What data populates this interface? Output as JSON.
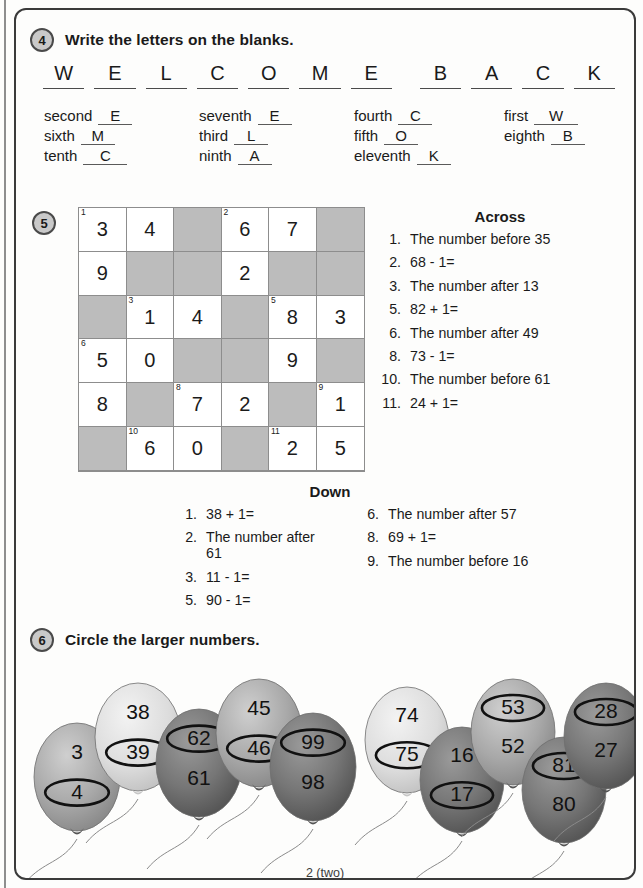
{
  "page": {
    "footer": "2 (two)"
  },
  "ex4": {
    "badge": "4",
    "title": "Write the letters on the blanks.",
    "letters": [
      "W",
      "E",
      "L",
      "C",
      "O",
      "M",
      "E",
      "",
      "B",
      "A",
      "C",
      "K"
    ],
    "ordinals": [
      {
        "word": "second",
        "answer": "E"
      },
      {
        "word": "seventh",
        "answer": "E"
      },
      {
        "word": "fourth",
        "answer": "C"
      },
      {
        "word": "first",
        "answer": "W"
      },
      {
        "word": "sixth",
        "answer": "M"
      },
      {
        "word": "third",
        "answer": "L"
      },
      {
        "word": "fifth",
        "answer": "O"
      },
      {
        "word": "eighth",
        "answer": "B"
      },
      {
        "word": "tenth",
        "answer": "C"
      },
      {
        "word": "ninth",
        "answer": "A"
      },
      {
        "word": "eleventh",
        "answer": "K"
      }
    ]
  },
  "ex5": {
    "badge": "5",
    "grid": [
      [
        {
          "v": "3",
          "b": false,
          "n": "1"
        },
        {
          "v": "4",
          "b": false,
          "n": ""
        },
        {
          "v": "",
          "b": true,
          "n": ""
        },
        {
          "v": "6",
          "b": false,
          "n": "2"
        },
        {
          "v": "7",
          "b": false,
          "n": ""
        },
        {
          "v": "",
          "b": true,
          "n": ""
        }
      ],
      [
        {
          "v": "9",
          "b": false,
          "n": ""
        },
        {
          "v": "",
          "b": true,
          "n": ""
        },
        {
          "v": "",
          "b": true,
          "n": ""
        },
        {
          "v": "2",
          "b": false,
          "n": ""
        },
        {
          "v": "",
          "b": true,
          "n": ""
        },
        {
          "v": "",
          "b": true,
          "n": ""
        }
      ],
      [
        {
          "v": "",
          "b": true,
          "n": ""
        },
        {
          "v": "1",
          "b": false,
          "n": "3"
        },
        {
          "v": "4",
          "b": false,
          "n": ""
        },
        {
          "v": "",
          "b": true,
          "n": ""
        },
        {
          "v": "8",
          "b": false,
          "n": "5"
        },
        {
          "v": "3",
          "b": false,
          "n": ""
        }
      ],
      [
        {
          "v": "5",
          "b": false,
          "n": "6"
        },
        {
          "v": "0",
          "b": false,
          "n": ""
        },
        {
          "v": "",
          "b": true,
          "n": ""
        },
        {
          "v": "",
          "b": true,
          "n": ""
        },
        {
          "v": "9",
          "b": false,
          "n": ""
        },
        {
          "v": "",
          "b": true,
          "n": ""
        }
      ],
      [
        {
          "v": "8",
          "b": false,
          "n": ""
        },
        {
          "v": "",
          "b": true,
          "n": ""
        },
        {
          "v": "7",
          "b": false,
          "n": "8"
        },
        {
          "v": "2",
          "b": false,
          "n": ""
        },
        {
          "v": "",
          "b": true,
          "n": ""
        },
        {
          "v": "1",
          "b": false,
          "n": "9"
        }
      ],
      [
        {
          "v": "",
          "b": true,
          "n": ""
        },
        {
          "v": "6",
          "b": false,
          "n": "10"
        },
        {
          "v": "0",
          "b": false,
          "n": ""
        },
        {
          "v": "",
          "b": true,
          "n": ""
        },
        {
          "v": "2",
          "b": false,
          "n": "11"
        },
        {
          "v": "5",
          "b": false,
          "n": ""
        }
      ]
    ],
    "across_heading": "Across",
    "across": [
      {
        "n": "1.",
        "t": "The number before 35"
      },
      {
        "n": "2.",
        "t": "68 - 1="
      },
      {
        "n": "3.",
        "t": "The number after 13"
      },
      {
        "n": "5.",
        "t": "82 + 1="
      },
      {
        "n": "6.",
        "t": "The number after 49"
      },
      {
        "n": "8.",
        "t": "73 - 1="
      },
      {
        "n": "10.",
        "t": "The number before 61"
      },
      {
        "n": "11.",
        "t": "24 + 1="
      }
    ],
    "down_heading": "Down",
    "down_left": [
      {
        "n": "1.",
        "t": "38 + 1="
      },
      {
        "n": "2.",
        "t": "The number after 61"
      },
      {
        "n": "3.",
        "t": "11 - 1="
      },
      {
        "n": "5.",
        "t": "90 - 1="
      }
    ],
    "down_right": [
      {
        "n": "6.",
        "t": "The number after 57"
      },
      {
        "n": "8.",
        "t": "69 + 1="
      },
      {
        "n": "9.",
        "t": "The number before 16"
      }
    ]
  },
  "ex6": {
    "badge": "6",
    "title": "Circle the larger numbers.",
    "balloons": [
      {
        "id": "balloon-1",
        "top": "3",
        "bottom": "4",
        "circled": "bottom",
        "shade": "mid",
        "x": 18,
        "y": 58,
        "w": 86,
        "h": 108
      },
      {
        "id": "balloon-2",
        "top": "38",
        "bottom": "39",
        "circled": "bottom",
        "shade": "light",
        "x": 79,
        "y": 18,
        "w": 86,
        "h": 108
      },
      {
        "id": "balloon-3",
        "top": "62",
        "bottom": "61",
        "circled": "top",
        "shade": "dark",
        "x": 140,
        "y": 44,
        "w": 86,
        "h": 108
      },
      {
        "id": "balloon-4",
        "top": "45",
        "bottom": "46",
        "circled": "bottom",
        "shade": "mid",
        "x": 200,
        "y": 14,
        "w": 86,
        "h": 108
      },
      {
        "id": "balloon-5",
        "top": "99",
        "bottom": "98",
        "circled": "top",
        "shade": "dark",
        "x": 254,
        "y": 48,
        "w": 86,
        "h": 108
      },
      {
        "id": "balloon-6",
        "top": "74",
        "bottom": "75",
        "circled": "bottom",
        "shade": "light",
        "x": 349,
        "y": 22,
        "w": 84,
        "h": 106
      },
      {
        "id": "balloon-7",
        "top": "16",
        "bottom": "17",
        "circled": "bottom",
        "shade": "dark",
        "x": 404,
        "y": 62,
        "w": 84,
        "h": 106
      },
      {
        "id": "balloon-8",
        "top": "53",
        "bottom": "52",
        "circled": "top",
        "shade": "mid",
        "x": 455,
        "y": 14,
        "w": 84,
        "h": 106
      },
      {
        "id": "balloon-9",
        "top": "81",
        "bottom": "80",
        "circled": "top",
        "shade": "dark",
        "x": 506,
        "y": 72,
        "w": 84,
        "h": 106
      },
      {
        "id": "balloon-10",
        "top": "28",
        "bottom": "27",
        "circled": "top",
        "shade": "dark",
        "x": 548,
        "y": 18,
        "w": 84,
        "h": 106
      }
    ]
  }
}
